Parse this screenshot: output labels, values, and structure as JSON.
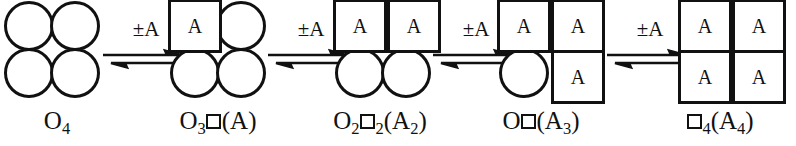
{
  "diagram": {
    "type": "reaction-scheme",
    "site_label": "A",
    "line_color": "#111111",
    "background": "#ffffff",
    "arrow_label": "±A",
    "clusters": [
      {
        "id": "cluster-1",
        "formula_plain": "O4",
        "formula_parts": [
          {
            "text": "O",
            "type": "text"
          },
          {
            "text": "4",
            "type": "sub"
          }
        ],
        "sites": [
          {
            "pos": "top-left",
            "shape": "circle",
            "label": ""
          },
          {
            "pos": "top-right",
            "shape": "circle",
            "label": ""
          },
          {
            "pos": "bottom-left",
            "shape": "circle",
            "label": ""
          },
          {
            "pos": "bottom-right",
            "shape": "circle",
            "label": ""
          }
        ]
      },
      {
        "id": "cluster-2",
        "formula_plain": "O3□(A)",
        "formula_parts": [
          {
            "text": "O",
            "type": "text"
          },
          {
            "text": "3",
            "type": "sub"
          },
          {
            "text": "",
            "type": "box"
          },
          {
            "text": "(A)",
            "type": "text"
          }
        ],
        "sites": [
          {
            "pos": "top-left",
            "shape": "square",
            "label": "A"
          },
          {
            "pos": "top-right",
            "shape": "circle",
            "label": ""
          },
          {
            "pos": "bottom-left",
            "shape": "circle",
            "label": ""
          },
          {
            "pos": "bottom-right",
            "shape": "circle",
            "label": ""
          }
        ]
      },
      {
        "id": "cluster-3",
        "formula_plain": "O2□2(A2)",
        "formula_parts": [
          {
            "text": "O",
            "type": "text"
          },
          {
            "text": "2",
            "type": "sub"
          },
          {
            "text": "",
            "type": "box"
          },
          {
            "text": "2",
            "type": "sub"
          },
          {
            "text": "(A",
            "type": "text"
          },
          {
            "text": "2",
            "type": "sub"
          },
          {
            "text": ")",
            "type": "text"
          }
        ],
        "sites": [
          {
            "pos": "top-left",
            "shape": "square",
            "label": "A"
          },
          {
            "pos": "top-right",
            "shape": "square",
            "label": "A"
          },
          {
            "pos": "bottom-left",
            "shape": "circle",
            "label": ""
          },
          {
            "pos": "bottom-right",
            "shape": "circle",
            "label": ""
          }
        ]
      },
      {
        "id": "cluster-4",
        "formula_plain": "O□(A3)",
        "formula_parts": [
          {
            "text": "O",
            "type": "text"
          },
          {
            "text": "",
            "type": "box"
          },
          {
            "text": "(A",
            "type": "text"
          },
          {
            "text": "3",
            "type": "sub"
          },
          {
            "text": ")",
            "type": "text"
          }
        ],
        "sites": [
          {
            "pos": "top-left",
            "shape": "square",
            "label": "A"
          },
          {
            "pos": "top-right",
            "shape": "square",
            "label": "A"
          },
          {
            "pos": "bottom-left",
            "shape": "circle",
            "label": ""
          },
          {
            "pos": "bottom-right",
            "shape": "square",
            "label": "A"
          }
        ]
      },
      {
        "id": "cluster-5",
        "formula_plain": "□4(A4)",
        "formula_parts": [
          {
            "text": "",
            "type": "box"
          },
          {
            "text": "4",
            "type": "sub"
          },
          {
            "text": "(A",
            "type": "text"
          },
          {
            "text": "4",
            "type": "sub"
          },
          {
            "text": ")",
            "type": "text"
          }
        ],
        "sites": [
          {
            "pos": "top-left",
            "shape": "square",
            "label": "A"
          },
          {
            "pos": "top-right",
            "shape": "square",
            "label": "A"
          },
          {
            "pos": "bottom-left",
            "shape": "square",
            "label": "A"
          },
          {
            "pos": "bottom-right",
            "shape": "square",
            "label": "A"
          }
        ]
      }
    ],
    "arrows": [
      {
        "id": "arrow-1",
        "label": "±A",
        "kind": "equilibrium"
      },
      {
        "id": "arrow-2",
        "label": "±A",
        "kind": "equilibrium"
      },
      {
        "id": "arrow-3",
        "label": "±A",
        "kind": "equilibrium"
      },
      {
        "id": "arrow-4",
        "label": "±A",
        "kind": "equilibrium"
      }
    ]
  }
}
